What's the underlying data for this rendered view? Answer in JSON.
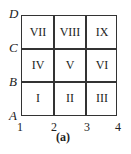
{
  "figure": {
    "caption": "(a)",
    "y_labels": [
      "A",
      "B",
      "C",
      "D"
    ],
    "x_labels": [
      "1",
      "2",
      "3",
      "4"
    ],
    "cells": [
      [
        "VII",
        "VIII",
        "IX"
      ],
      [
        "IV",
        "V",
        "VI"
      ],
      [
        "I",
        "II",
        "III"
      ]
    ]
  }
}
